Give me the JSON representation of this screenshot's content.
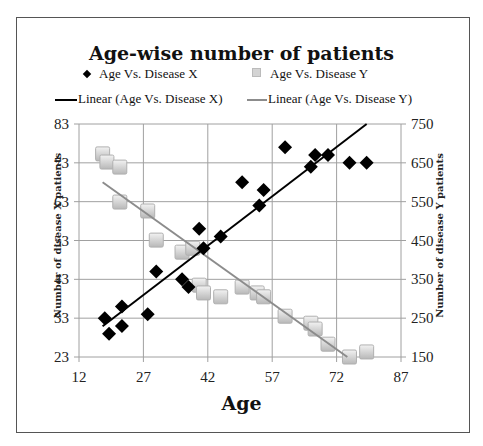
{
  "chart_data": {
    "type": "scatter",
    "title": "Age-wise number of patients",
    "xlabel": "Age",
    "ylabel": "Number of disease X patients",
    "ylabel_right": "Number of disease Y patients",
    "xlim": [
      12,
      87
    ],
    "ylim": [
      23,
      83
    ],
    "ylim_right": [
      150,
      750
    ],
    "x_ticks": [
      12,
      27,
      42,
      57,
      72,
      87
    ],
    "y_ticks": [
      23,
      33,
      43,
      53,
      63,
      73,
      83
    ],
    "y_ticks_right": [
      150,
      250,
      350,
      450,
      550,
      650,
      750
    ],
    "grid": true,
    "legend_position": "top",
    "legend": [
      "Age Vs. Disease X",
      "Age Vs. Disease Y",
      "Linear  (Age Vs. Disease X)",
      "Linear  (Age Vs. Disease Y)"
    ],
    "series": [
      {
        "name": "Age Vs. Disease X",
        "axis": "left",
        "marker": "diamond",
        "color": "#000000",
        "x": [
          18,
          19,
          22,
          22,
          28,
          30,
          36,
          37.5,
          40,
          41,
          45,
          50,
          54,
          55,
          60,
          66,
          67,
          70,
          75,
          79
        ],
        "y": [
          33,
          29,
          36,
          31,
          34,
          45,
          43,
          41,
          56,
          51,
          54,
          68,
          62,
          66,
          77,
          72,
          75,
          75,
          73,
          73
        ]
      },
      {
        "name": "Age Vs. Disease Y",
        "axis": "right",
        "marker": "square",
        "color": "#c8c8c8",
        "x": [
          17.5,
          18.5,
          21.5,
          21.5,
          28,
          30,
          36,
          38.5,
          40,
          41,
          45,
          50,
          53.5,
          55,
          60,
          66,
          67,
          70,
          75,
          79
        ],
        "y": [
          673,
          652,
          639,
          549,
          526,
          451,
          420,
          430,
          335,
          315,
          305,
          330,
          315,
          305,
          255,
          237,
          222,
          183,
          150,
          163
        ]
      }
    ],
    "trendlines": [
      {
        "name": "Linear  (Age Vs. Disease X)",
        "axis": "left",
        "color": "#000000",
        "x": [
          17.5,
          79
        ],
        "y": [
          30.9,
          83
        ]
      },
      {
        "name": "Linear  (Age Vs. Disease Y)",
        "axis": "right",
        "color": "#8c8c8c",
        "x": [
          17.5,
          74.5
        ],
        "y": [
          600,
          150
        ]
      }
    ]
  }
}
